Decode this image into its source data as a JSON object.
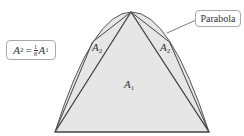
{
  "diagram": {
    "parabola": {
      "apex": [
        131,
        12
      ],
      "left_base": [
        55,
        132
      ],
      "right_base": [
        209,
        132
      ],
      "left_mid": [
        92.5,
        42
      ],
      "right_mid": [
        169.5,
        42
      ]
    },
    "colors": {
      "fill": "#e6e6e6",
      "stroke": "#444444",
      "callout_border": "#a9a9a9",
      "text": "#333333"
    }
  },
  "labels": {
    "parabola": "Parabola",
    "formula": {
      "lhs_var": "A",
      "lhs_sub": "2",
      "equals": "=",
      "frac_num": "1",
      "frac_den": "8",
      "rhs_var": "A",
      "rhs_sub": "1"
    },
    "region_a1": {
      "var": "A",
      "sub": "1"
    },
    "region_a2_left": {
      "var": "A",
      "sub": "2"
    },
    "region_a2_right": {
      "var": "A",
      "sub": "2"
    }
  }
}
